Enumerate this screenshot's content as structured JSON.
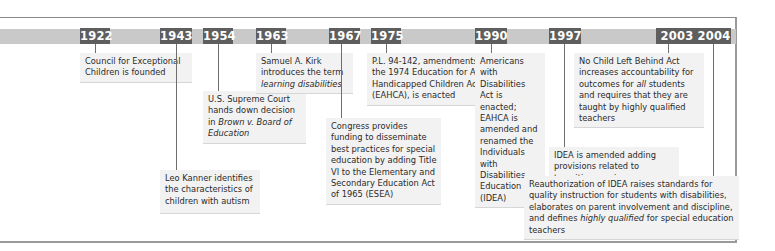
{
  "timeline": {
    "events": [
      {
        "year": "1922",
        "text_parts": [
          {
            "t": "Council for Exceptional Children is founded"
          }
        ]
      },
      {
        "year": "1943",
        "text_parts": [
          {
            "t": "Leo Kanner identifies the characteristics of children with autism"
          }
        ]
      },
      {
        "year": "1954",
        "text_parts": [
          {
            "t": "U.S. Supreme Court hands down decision in "
          },
          {
            "t": "Brown v. Board of Education",
            "i": true
          }
        ]
      },
      {
        "year": "1963",
        "text_parts": [
          {
            "t": "Samuel A. Kirk introduces the term "
          },
          {
            "t": "learning disabilities",
            "i": true
          }
        ]
      },
      {
        "year": "1967",
        "text_parts": [
          {
            "t": "Congress provides funding to disseminate best practices for special education by adding Title VI to the Elementary and Secondary Education Act of 1965 (ESEA)"
          }
        ]
      },
      {
        "year": "1975",
        "text_parts": [
          {
            "t": "P.L. 94-142, amendments to the 1974 Education for All Handicapped Children Act (EAHCA), is enacted"
          }
        ]
      },
      {
        "year": "1990",
        "text_parts": [
          {
            "t": "Americans with Disabilities Act is enacted; EAHCA is amended and renamed the Individuals with Disabilities Education Act (IDEA)"
          }
        ]
      },
      {
        "year": "1997",
        "text_parts": [
          {
            "t": "IDEA is amended adding provisions related to transition services, participation by general education teachers, and discipline"
          }
        ]
      },
      {
        "year": "2003",
        "text_parts": [
          {
            "t": "No Child Left Behind Act increases accountability for outcomes for "
          },
          {
            "t": "all",
            "i": true
          },
          {
            "t": " students and requires that they are taught by highly qualified teachers"
          }
        ]
      },
      {
        "year": "2004",
        "text_parts": [
          {
            "t": "Reauthorization of IDEA raises standards for quality instruction for students with disabilities, elaborates on parent involvement and discipline, and defines "
          },
          {
            "t": "highly qualified",
            "i": true
          },
          {
            "t": " for special education teachers"
          }
        ]
      }
    ]
  },
  "colors": {
    "bar": "#c9c9c9",
    "year_tab": "#5e5e5e",
    "box_bg": "#f2f2f2"
  }
}
